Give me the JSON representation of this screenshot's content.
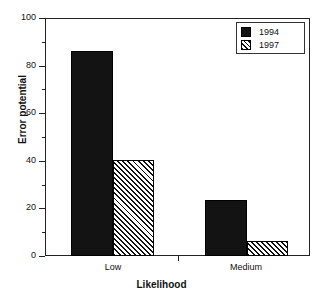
{
  "chart_data": {
    "type": "bar",
    "title": "",
    "subtitle": "",
    "xlabel": "Likelihood",
    "ylabel": "Error potential",
    "categories": [
      "Low",
      "Medium"
    ],
    "series": [
      {
        "name": "1994",
        "values": [
          86,
          23.5
        ],
        "fill": "solid",
        "color": "#131313"
      },
      {
        "name": "1997",
        "values": [
          40.5,
          6.5
        ],
        "fill": "diagonal-hatch",
        "color": "#d8d8d8"
      }
    ],
    "ylim": [
      0,
      100
    ],
    "yticks": [
      0,
      20,
      40,
      60,
      80,
      100
    ],
    "ytick_labels": [
      "0",
      "20",
      "40",
      "60",
      "80",
      "100"
    ],
    "yminor_ticks": [
      10,
      30,
      50,
      70,
      90
    ],
    "grid": false,
    "legend_position": "top-right",
    "legend_entries": [
      "1994",
      "1997"
    ],
    "frame": true
  },
  "axes": {
    "y": {
      "label": "Error potential",
      "ticks": [
        {
          "value": 100,
          "label": "100"
        },
        {
          "value": 90,
          "label": ""
        },
        {
          "value": 80,
          "label": "80"
        },
        {
          "value": 70,
          "label": ""
        },
        {
          "value": 60,
          "label": "60"
        },
        {
          "value": 50,
          "label": ""
        },
        {
          "value": 40,
          "label": "40"
        },
        {
          "value": 30,
          "label": ""
        },
        {
          "value": 20,
          "label": "20"
        },
        {
          "value": 10,
          "label": ""
        },
        {
          "value": 0,
          "label": "0"
        }
      ]
    },
    "x": {
      "label": "Likelihood",
      "ticks": [
        {
          "label": "Low"
        },
        {
          "label": "Medium"
        }
      ]
    }
  },
  "legend": {
    "items": [
      {
        "label": "1994",
        "swatch": "solid-square-swatch"
      },
      {
        "label": "1997",
        "swatch": "hatched-square-swatch"
      }
    ]
  },
  "colors": {
    "series_1994": "#131313",
    "series_1997": "#d8d8d8",
    "axis": "#222222",
    "background": "#ffffff"
  }
}
